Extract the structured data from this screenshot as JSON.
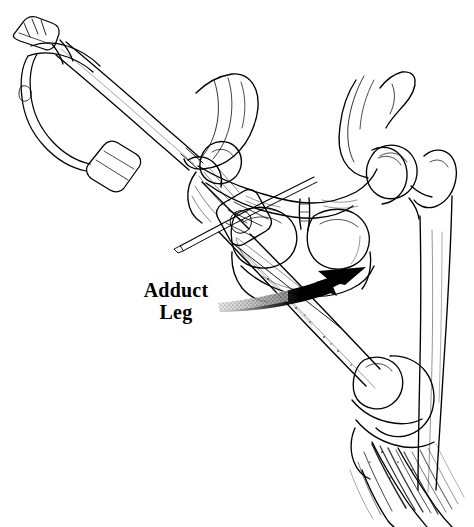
{
  "figure": {
    "kind": "surgical-technique-line-illustration",
    "medium": "pen-and-ink stipple and hatch drawing",
    "background_color": "#ffffff",
    "ink_color": "#000000",
    "width": 474,
    "height": 527,
    "view": "anteroposterior (AP) view of pelvis and right femur"
  },
  "annotations": {
    "callout": {
      "line1": "Adduct",
      "line2": "Leg",
      "full_text": "Adduct Leg",
      "font_weight": "bold",
      "font_size_px": 20,
      "color": "#000000",
      "x": 136,
      "y": 280
    },
    "arrow": {
      "name": "adduct-direction-arrow",
      "style": "thick curved sweep arrow with stippled fading tail",
      "color": "#000000",
      "tail_x": 218,
      "tail_y": 302,
      "tip_x": 366,
      "tip_y": 267,
      "direction": "up and to the right",
      "meaning": "direction to adduct the leg"
    }
  },
  "anatomy": [
    {
      "name": "pelvis",
      "detail": "ilium, superior and inferior pubic rami, ischium, obturator foramina, pubic symphysis"
    },
    {
      "name": "left-obturator-foramen",
      "detail": "oval opening, left side of drawing"
    },
    {
      "name": "right-obturator-foramen",
      "detail": "oval opening, right side of drawing"
    },
    {
      "name": "pubic-symphysis",
      "detail": "midline junction of pubic bones"
    },
    {
      "name": "contralateral-femur",
      "detail": "intact femoral head seated in acetabulum, neck, greater trochanter and shaft descending to the right"
    },
    {
      "name": "operative-femur",
      "detail": "proximal femur with fracture fixation implant, shaft angling down and to the right toward the knee"
    },
    {
      "name": "greater-trochanter",
      "detail": "lateral prominence at proximal femur, entry point for implant"
    },
    {
      "name": "knee-joint",
      "detail": "distal femoral condyles, patella and proximal tibia"
    },
    {
      "name": "patella",
      "detail": "rounded sesamoid bone overlying the distal femur"
    },
    {
      "name": "tibia-and-fibula",
      "detail": "lower leg bones hatched and fading toward the lower border"
    }
  ],
  "instrument": {
    "name": "insertion-handle-assembly",
    "parts": [
      {
        "name": "slotted-handle-tip",
        "detail": "forked impaction tip at upper left"
      },
      {
        "name": "bow-frame",
        "detail": "triangular open bow of the handle"
      },
      {
        "name": "cross-bar",
        "detail": "transverse T bar of the handle"
      },
      {
        "name": "drive-shaft",
        "detail": "long straight double-line rod running from the handle down to the greater trochanter"
      },
      {
        "name": "guide-block",
        "detail": "clamp and aiming block seated on the lateral femoral shaft"
      },
      {
        "name": "guide-pin",
        "detail": "wire crossing obliquely through the guide block"
      }
    ]
  }
}
